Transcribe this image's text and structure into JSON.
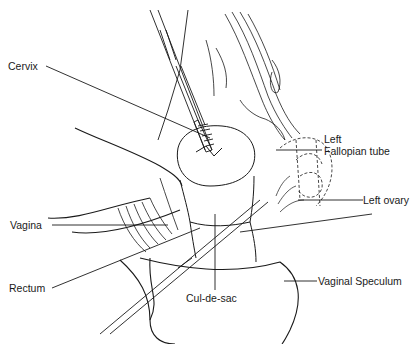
{
  "diagram": {
    "labels": {
      "cervix": "Cervix",
      "left_fallopian_tube_line1": "Left",
      "left_fallopian_tube_line2": "Fallopian  tube",
      "left_ovary": "Left ovary",
      "vagina": "Vagina",
      "rectum": "Rectum",
      "cul_de_sac": "Cul-de-sac",
      "vaginal_speculum": "Vaginal Speculum"
    },
    "colors": {
      "ink": "#1a1a1a",
      "background": "#ffffff"
    }
  }
}
